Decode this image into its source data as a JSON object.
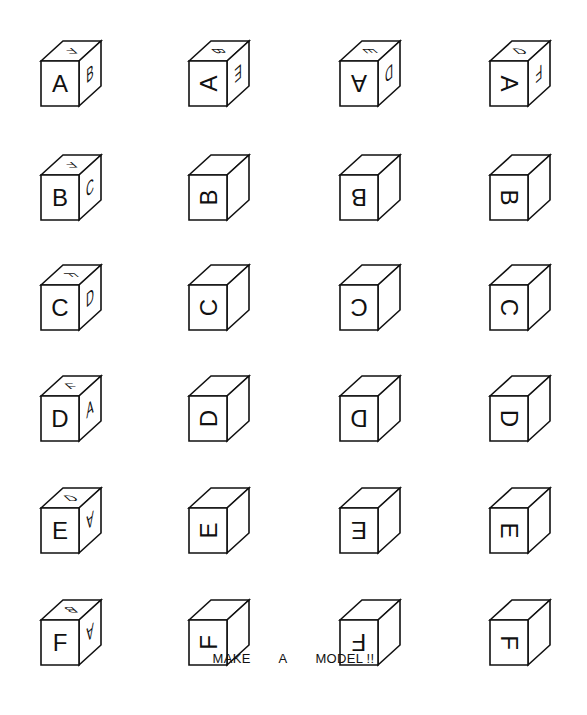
{
  "caption": {
    "words": [
      "MAKE",
      "A",
      "MODEL !!"
    ]
  },
  "rows": [
    {
      "letter": "A",
      "cubes": [
        {
          "front": "A",
          "front_rot": 0,
          "top": "F",
          "top_rot": 180,
          "right": "B",
          "right_rot": 0
        },
        {
          "front": "A",
          "front_rot": -90,
          "top": "B",
          "top_rot": 90,
          "right": "E",
          "right_rot": 180
        },
        {
          "front": "A",
          "front_rot": 180,
          "top": "E",
          "top_rot": 90,
          "right": "D",
          "right_rot": 180
        },
        {
          "front": "A",
          "front_rot": 90,
          "top": "D",
          "top_rot": 0,
          "right": "F",
          "right_rot": 180
        }
      ]
    },
    {
      "letter": "B",
      "cubes": [
        {
          "front": "B",
          "front_rot": 0,
          "top": "F",
          "top_rot": 180,
          "right": "C",
          "right_rot": 0
        },
        {
          "front": "B",
          "front_rot": -90
        },
        {
          "front": "B",
          "front_rot": 180
        },
        {
          "front": "B",
          "front_rot": 90
        }
      ]
    },
    {
      "letter": "C",
      "cubes": [
        {
          "front": "C",
          "front_rot": 0,
          "top": "F",
          "top_rot": 90,
          "right": "D",
          "right_rot": 0
        },
        {
          "front": "C",
          "front_rot": -90
        },
        {
          "front": "C",
          "front_rot": 180
        },
        {
          "front": "C",
          "front_rot": 90
        }
      ]
    },
    {
      "letter": "D",
      "cubes": [
        {
          "front": "D",
          "front_rot": 0,
          "top": "F",
          "top_rot": 0,
          "right": "A",
          "right_rot": 0
        },
        {
          "front": "D",
          "front_rot": -90
        },
        {
          "front": "D",
          "front_rot": 180
        },
        {
          "front": "D",
          "front_rot": 90
        }
      ]
    },
    {
      "letter": "E",
      "cubes": [
        {
          "front": "E",
          "front_rot": 0,
          "top": "D",
          "top_rot": 0,
          "right": "A",
          "right_rot": 180
        },
        {
          "front": "E",
          "front_rot": -90
        },
        {
          "front": "E",
          "front_rot": 180
        },
        {
          "front": "E",
          "front_rot": 90
        }
      ]
    },
    {
      "letter": "F",
      "cubes": [
        {
          "front": "F",
          "front_rot": 0,
          "top": "B",
          "top_rot": 180,
          "right": "A",
          "right_rot": 180
        },
        {
          "front": "F",
          "front_rot": -90
        },
        {
          "front": "F",
          "front_rot": 180
        },
        {
          "front": "F",
          "front_rot": 90
        }
      ]
    }
  ]
}
